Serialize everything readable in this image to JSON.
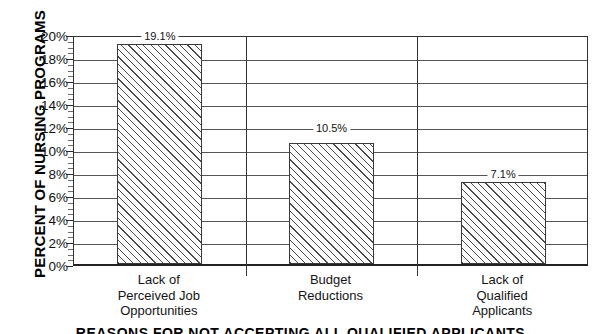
{
  "chart_data": {
    "type": "bar",
    "title": "",
    "xlabel": "REASONS FOR NOT ACCEPTING ALL QUALIFIED APPLICANTS",
    "ylabel": "PERCENT OF NURSING PROGRAMS",
    "categories": [
      "Lack of\nPerceived Job\nOpportunities",
      "Budget\nReductions",
      "Lack of\nQualified\nApplicants"
    ],
    "category_lines": [
      [
        "Lack of",
        "Perceived Job",
        "Opportunities"
      ],
      [
        "Budget",
        "Reductions"
      ],
      [
        "Lack of",
        "Qualified",
        "Applicants"
      ]
    ],
    "values": [
      19.1,
      10.5,
      7.1
    ],
    "data_labels": [
      "19.1%",
      "10.5%",
      "7.1%"
    ],
    "ylim": [
      0,
      20
    ],
    "ytick_step": 2,
    "ytick_labels": [
      "20%",
      "18%",
      "16%",
      "14%",
      "12%",
      "10%",
      "8%",
      "6%",
      "4%",
      "2%",
      "0%"
    ],
    "ytick_values": [
      20,
      18,
      16,
      14,
      12,
      10,
      8,
      6,
      4,
      2,
      0
    ],
    "minor_tick_step": 0.5,
    "grid": true,
    "legend": false,
    "bar_fill": "hatched-diagonal",
    "colors": {
      "bar_edge": "#3a3a3a",
      "bar_hatch": "#4a4a4a",
      "axis": "#222222",
      "gridline": "#555555",
      "text": "#111111",
      "background": "#ffffff"
    }
  }
}
